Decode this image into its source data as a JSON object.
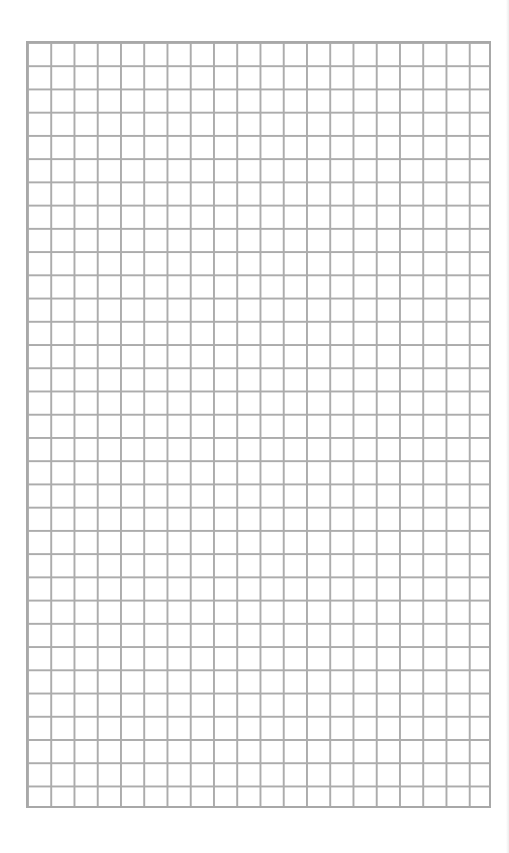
{
  "page": {
    "type": "grid-paper",
    "grid": {
      "columns": 20,
      "rows": 33,
      "line_color": "#acacac",
      "background_color": "#ffffff"
    }
  }
}
